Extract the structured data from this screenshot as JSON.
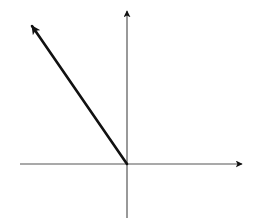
{
  "diagram": {
    "type": "coordinate-axes-with-vector",
    "colors": {
      "background": "#ffffff",
      "axis": "#555555",
      "vector": "#111111"
    },
    "origin": {
      "x": 127,
      "y": 164
    },
    "x_axis": {
      "start": {
        "x": 20,
        "y": 164
      },
      "end": {
        "x": 242,
        "y": 164
      },
      "arrow": "right"
    },
    "y_axis": {
      "start": {
        "x": 127,
        "y": 218
      },
      "end": {
        "x": 127,
        "y": 11
      },
      "arrow": "up"
    },
    "vector": {
      "from": {
        "x": 127,
        "y": 164
      },
      "to": {
        "x": 32,
        "y": 26
      },
      "direction": "up-left"
    }
  }
}
